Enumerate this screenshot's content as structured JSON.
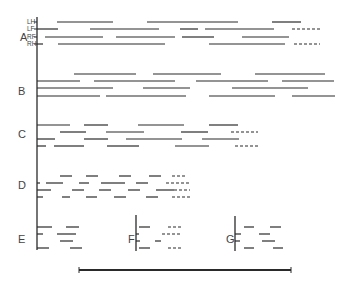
{
  "groups": [
    {
      "label": "A",
      "label_pos": [
        20,
        38
      ],
      "limb_labels": [
        "LH",
        "LF",
        "RF",
        "RH"
      ]
    },
    {
      "label": "B",
      "label_pos": [
        18,
        92
      ]
    },
    {
      "label": "C",
      "label_pos": [
        18,
        135
      ]
    },
    {
      "label": "D",
      "label_pos": [
        18,
        186
      ]
    },
    {
      "label": "E",
      "label_pos": [
        18,
        240
      ]
    },
    {
      "label": "F",
      "label_pos": [
        128,
        240
      ]
    },
    {
      "label": "G",
      "label_pos": [
        226,
        240
      ]
    }
  ],
  "axes": [
    {
      "x": 37,
      "y1": 17,
      "y2": 250
    },
    {
      "x": 136,
      "y1": 215,
      "y2": 251
    },
    {
      "x": 235,
      "y1": 216,
      "y2": 251
    }
  ],
  "segments": [
    {
      "y": 22,
      "x1": 57,
      "x2": 113
    },
    {
      "y": 22,
      "x1": 147,
      "x2": 238
    },
    {
      "y": 22,
      "x1": 272,
      "x2": 301
    },
    {
      "y": 29,
      "x1": 37,
      "x2": 58
    },
    {
      "y": 29,
      "x1": 90,
      "x2": 159
    },
    {
      "y": 29,
      "x1": 180,
      "x2": 198
    },
    {
      "y": 29,
      "x1": 205,
      "x2": 274
    },
    {
      "y": 29,
      "x1": 292,
      "x2": 320,
      "dashed": true
    },
    {
      "y": 37,
      "x1": 45,
      "x2": 103
    },
    {
      "y": 37,
      "x1": 116,
      "x2": 175
    },
    {
      "y": 37,
      "x1": 182,
      "x2": 214
    },
    {
      "y": 37,
      "x1": 242,
      "x2": 289
    },
    {
      "y": 44,
      "x1": 37,
      "x2": 43
    },
    {
      "y": 44,
      "x1": 58,
      "x2": 165
    },
    {
      "y": 44,
      "x1": 209,
      "x2": 285
    },
    {
      "y": 44,
      "x1": 294,
      "x2": 320,
      "dashed": true
    },
    {
      "y": 74,
      "x1": 74,
      "x2": 136
    },
    {
      "y": 74,
      "x1": 153,
      "x2": 221
    },
    {
      "y": 74,
      "x1": 255,
      "x2": 325
    },
    {
      "y": 81,
      "x1": 37,
      "x2": 80
    },
    {
      "y": 81,
      "x1": 94,
      "x2": 175
    },
    {
      "y": 81,
      "x1": 196,
      "x2": 268
    },
    {
      "y": 81,
      "x1": 282,
      "x2": 334
    },
    {
      "y": 88,
      "x1": 37,
      "x2": 113
    },
    {
      "y": 88,
      "x1": 143,
      "x2": 190
    },
    {
      "y": 88,
      "x1": 232,
      "x2": 308
    },
    {
      "y": 96,
      "x1": 37,
      "x2": 100
    },
    {
      "y": 96,
      "x1": 106,
      "x2": 186
    },
    {
      "y": 96,
      "x1": 209,
      "x2": 275
    },
    {
      "y": 96,
      "x1": 292,
      "x2": 335
    },
    {
      "y": 125,
      "x1": 37,
      "x2": 70
    },
    {
      "y": 125,
      "x1": 84,
      "x2": 108
    },
    {
      "y": 125,
      "x1": 138,
      "x2": 184
    },
    {
      "y": 125,
      "x1": 209,
      "x2": 238
    },
    {
      "y": 132,
      "x1": 60,
      "x2": 86
    },
    {
      "y": 132,
      "x1": 106,
      "x2": 144
    },
    {
      "y": 132,
      "x1": 181,
      "x2": 208
    },
    {
      "y": 132,
      "x1": 231,
      "x2": 258,
      "dashed": true
    },
    {
      "y": 139,
      "x1": 37,
      "x2": 55
    },
    {
      "y": 139,
      "x1": 84,
      "x2": 108
    },
    {
      "y": 139,
      "x1": 126,
      "x2": 182
    },
    {
      "y": 139,
      "x1": 202,
      "x2": 239
    },
    {
      "y": 146,
      "x1": 37,
      "x2": 46
    },
    {
      "y": 146,
      "x1": 54,
      "x2": 84
    },
    {
      "y": 146,
      "x1": 107,
      "x2": 139
    },
    {
      "y": 146,
      "x1": 175,
      "x2": 209
    },
    {
      "y": 146,
      "x1": 235,
      "x2": 260,
      "dashed": true
    },
    {
      "y": 176,
      "x1": 60,
      "x2": 72
    },
    {
      "y": 176,
      "x1": 86,
      "x2": 98
    },
    {
      "y": 176,
      "x1": 119,
      "x2": 131
    },
    {
      "y": 176,
      "x1": 149,
      "x2": 161
    },
    {
      "y": 176,
      "x1": 172,
      "x2": 187,
      "dashed": true
    },
    {
      "y": 183,
      "x1": 37,
      "x2": 40
    },
    {
      "y": 183,
      "x1": 46,
      "x2": 63
    },
    {
      "y": 183,
      "x1": 79,
      "x2": 89
    },
    {
      "y": 183,
      "x1": 101,
      "x2": 125
    },
    {
      "y": 183,
      "x1": 136,
      "x2": 148
    },
    {
      "y": 183,
      "x1": 166,
      "x2": 190,
      "dashed": true
    },
    {
      "y": 190,
      "x1": 37,
      "x2": 51
    },
    {
      "y": 190,
      "x1": 72,
      "x2": 84
    },
    {
      "y": 190,
      "x1": 99,
      "x2": 111
    },
    {
      "y": 190,
      "x1": 128,
      "x2": 140
    },
    {
      "y": 190,
      "x1": 156,
      "x2": 174
    },
    {
      "y": 190,
      "x1": 174,
      "x2": 190,
      "dashed": true
    },
    {
      "y": 197,
      "x1": 37,
      "x2": 43
    },
    {
      "y": 197,
      "x1": 62,
      "x2": 70
    },
    {
      "y": 197,
      "x1": 86,
      "x2": 97
    },
    {
      "y": 197,
      "x1": 114,
      "x2": 126
    },
    {
      "y": 197,
      "x1": 146,
      "x2": 158
    },
    {
      "y": 197,
      "x1": 172,
      "x2": 190,
      "dashed": true
    },
    {
      "y": 227,
      "x1": 37,
      "x2": 52
    },
    {
      "y": 227,
      "x1": 66,
      "x2": 79
    },
    {
      "y": 234,
      "x1": 37,
      "x2": 43
    },
    {
      "y": 234,
      "x1": 57,
      "x2": 76
    },
    {
      "y": 241,
      "x1": 60,
      "x2": 73
    },
    {
      "y": 248,
      "x1": 37,
      "x2": 49
    },
    {
      "y": 248,
      "x1": 70,
      "x2": 82
    },
    {
      "y": 227,
      "x1": 139,
      "x2": 150
    },
    {
      "y": 227,
      "x1": 168,
      "x2": 182,
      "dashed": true
    },
    {
      "y": 234,
      "x1": 136,
      "x2": 139
    },
    {
      "y": 234,
      "x1": 162,
      "x2": 181,
      "dashed": true
    },
    {
      "y": 241,
      "x1": 136,
      "x2": 140
    },
    {
      "y": 241,
      "x1": 155,
      "x2": 161
    },
    {
      "y": 248,
      "x1": 139,
      "x2": 150
    },
    {
      "y": 248,
      "x1": 168,
      "x2": 182,
      "dashed": true
    },
    {
      "y": 227,
      "x1": 244,
      "x2": 254
    },
    {
      "y": 227,
      "x1": 270,
      "x2": 281
    },
    {
      "y": 234,
      "x1": 235,
      "x2": 241
    },
    {
      "y": 234,
      "x1": 259,
      "x2": 270
    },
    {
      "y": 241,
      "x1": 235,
      "x2": 240
    },
    {
      "y": 241,
      "x1": 262,
      "x2": 275
    },
    {
      "y": 248,
      "x1": 244,
      "x2": 254
    },
    {
      "y": 248,
      "x1": 273,
      "x2": 283
    }
  ],
  "ticks": [
    {
      "x": 37,
      "y": 22
    },
    {
      "x": 37,
      "y": 29
    },
    {
      "x": 37,
      "y": 37
    },
    {
      "x": 37,
      "y": 44
    }
  ],
  "scale_bar": {
    "x1": 79,
    "x2": 291,
    "y": 270
  },
  "colors": {
    "line": "#2a2a2a",
    "text": "#444444"
  }
}
